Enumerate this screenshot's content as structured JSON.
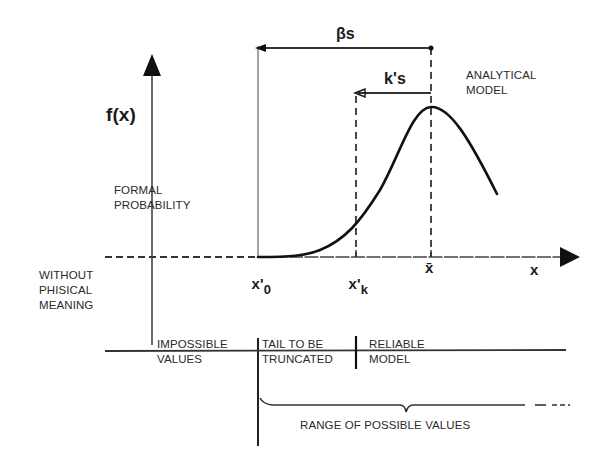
{
  "diagram": {
    "axes": {
      "y_label": "f(x)",
      "x_label": "x"
    },
    "ticks": {
      "x0": {
        "base": "x'",
        "sub": "0"
      },
      "xk": {
        "base": "x'",
        "sub": "k"
      },
      "xbar": "x̄"
    },
    "dimensions": {
      "beta_s": "βs",
      "k_s": "k's"
    },
    "annotations": {
      "analytical_model": [
        "ANALYTICAL",
        "MODEL"
      ],
      "formal_probability": [
        "FORMAL",
        "PROBABILITY"
      ],
      "without_physical_meaning": [
        "WITHOUT",
        "PHISICAL",
        "MEANING"
      ]
    },
    "zones": [
      {
        "line1": "IMPOSSIBLE",
        "line2": "VALUES"
      },
      {
        "line1": "TAIL TO BE",
        "line2": "TRUNCATED"
      },
      {
        "line1": "RELIABLE",
        "line2": "MODEL"
      }
    ],
    "range_label": "RANGE OF POSSIBLE VALUES",
    "colors": {
      "ink": "#1a1a1a",
      "background": "#ffffff"
    }
  }
}
